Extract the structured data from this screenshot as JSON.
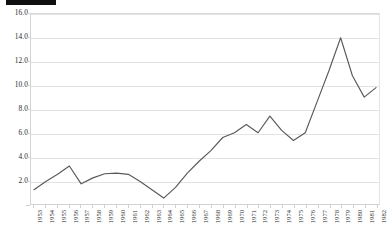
{
  "redaction": {
    "name": "redacted-title-bar",
    "color": "#101010"
  },
  "chart_data": {
    "type": "line",
    "title": "",
    "subtitle": "",
    "xlabel": "",
    "ylabel": "",
    "grid": true,
    "legend": false,
    "legend_position": "none",
    "line_color": "#595959",
    "background_color": "#ffffff",
    "gridline_color": "#e3e3e3",
    "ylim": [
      0,
      16
    ],
    "ytick_values": [
      0,
      2,
      4,
      6,
      8,
      10,
      12,
      14,
      16
    ],
    "ytick_labels": [
      "-",
      "2.0",
      "4.0",
      "6.0",
      "8.0",
      "10.0",
      "12.0",
      "14.0",
      "16.0"
    ],
    "categories": [
      "1953",
      "1954",
      "1955",
      "1956",
      "1957",
      "1958",
      "1959",
      "1960",
      "1961",
      "1962",
      "1963",
      "1964",
      "1965",
      "1966",
      "1967",
      "1968",
      "1969",
      "1970",
      "1971",
      "1972",
      "1973",
      "1974",
      "1975",
      "1976",
      "1977",
      "1978",
      "1979",
      "1980",
      "1981",
      "1982"
    ],
    "values": [
      1.2,
      1.9,
      2.5,
      3.2,
      1.7,
      2.2,
      2.55,
      2.6,
      2.5,
      1.9,
      1.2,
      0.5,
      1.4,
      2.6,
      3.6,
      4.5,
      5.6,
      6.0,
      6.7,
      6.0,
      7.4,
      6.2,
      5.35,
      6.0,
      8.6,
      11.2,
      14.0,
      10.8,
      9.0,
      9.8
    ],
    "series": [
      {
        "name": "series-1",
        "values": [
          1.2,
          1.9,
          2.5,
          3.2,
          1.7,
          2.2,
          2.55,
          2.6,
          2.5,
          1.9,
          1.2,
          0.5,
          1.4,
          2.6,
          3.6,
          4.5,
          5.6,
          6.0,
          6.7,
          6.0,
          7.4,
          6.2,
          5.35,
          6.0,
          8.6,
          11.2,
          14.0,
          10.8,
          9.0,
          9.8
        ]
      }
    ]
  }
}
